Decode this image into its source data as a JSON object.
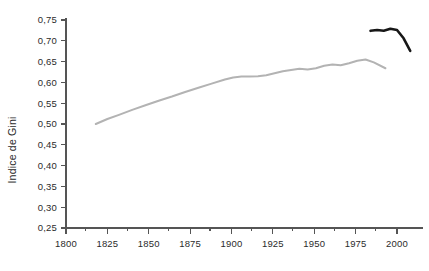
{
  "chart_data": {
    "type": "line",
    "title": "",
    "subtitle": "",
    "xlabel": "",
    "ylabel": "Indice de Gini",
    "xlim": [
      1795,
      2015
    ],
    "ylim": [
      0.25,
      0.75
    ],
    "grid": false,
    "legend_position": "none",
    "xticks": [
      1800,
      1825,
      1850,
      1875,
      1900,
      1925,
      1950,
      1975,
      2000
    ],
    "xtick_labels": [
      "1800",
      "1825",
      "1850",
      "1875",
      "1900",
      "1925",
      "1950",
      "1975",
      "2000"
    ],
    "yticks": [
      0.25,
      0.3,
      0.35,
      0.4,
      0.45,
      0.5,
      0.55,
      0.6,
      0.65,
      0.7,
      0.75
    ],
    "ytick_labels": [
      "0,25",
      "0,30",
      "0,35",
      "0,40",
      "0,45",
      "0,50",
      "0,55",
      "0,60",
      "0,65",
      "0,70",
      "0,75"
    ],
    "minor_xticks": [
      1812,
      1837,
      1862,
      1887,
      1912,
      1937,
      1962,
      1987
    ],
    "series": [
      {
        "name": "serie-historique",
        "color": "#b3b3b3",
        "width": 2.0,
        "x": [
          1818,
          1825,
          1832,
          1840,
          1848,
          1856,
          1864,
          1872,
          1880,
          1888,
          1896,
          1901,
          1906,
          1911,
          1916,
          1921,
          1926,
          1931,
          1936,
          1941,
          1946,
          1951,
          1956,
          1961,
          1966,
          1971,
          1976,
          1981,
          1986,
          1993
        ],
        "values": [
          0.5,
          0.512,
          0.522,
          0.534,
          0.545,
          0.556,
          0.566,
          0.577,
          0.587,
          0.597,
          0.607,
          0.612,
          0.614,
          0.614,
          0.615,
          0.617,
          0.622,
          0.627,
          0.63,
          0.633,
          0.631,
          0.634,
          0.64,
          0.643,
          0.641,
          0.646,
          0.652,
          0.655,
          0.648,
          0.634
        ]
      },
      {
        "name": "serie-recente",
        "color": "#171717",
        "width": 2.6,
        "x": [
          1984,
          1988,
          1992,
          1996,
          2000,
          2004,
          2008
        ],
        "values": [
          0.724,
          0.726,
          0.724,
          0.729,
          0.726,
          0.706,
          0.676
        ]
      }
    ]
  }
}
